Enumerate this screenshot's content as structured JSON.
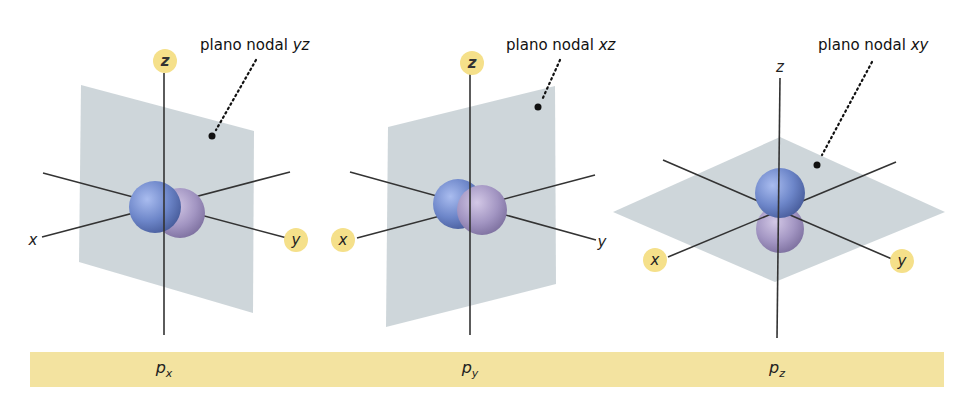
{
  "figure": {
    "panels": [
      {
        "id": "px",
        "orbital_label": "p",
        "orbital_subscript": "x",
        "nodal_plane_prefix": "plano nodal",
        "nodal_plane_axes": "yz",
        "axis_labels": {
          "x": "x",
          "y": "y",
          "z": "z"
        },
        "highlighted_axes": [
          "z",
          "y"
        ]
      },
      {
        "id": "py",
        "orbital_label": "p",
        "orbital_subscript": "y",
        "nodal_plane_prefix": "plano nodal",
        "nodal_plane_axes": "xz",
        "axis_labels": {
          "x": "x",
          "y": "y",
          "z": "z"
        },
        "highlighted_axes": [
          "z",
          "x"
        ]
      },
      {
        "id": "pz",
        "orbital_label": "p",
        "orbital_subscript": "z",
        "nodal_plane_prefix": "plano nodal",
        "nodal_plane_axes": "xy",
        "axis_labels": {
          "x": "x",
          "y": "y",
          "z": "z"
        },
        "highlighted_axes": [
          "x",
          "y"
        ]
      }
    ],
    "colors": {
      "caption_bar": "#f3e3a0",
      "axis_badge": "#f5e08a",
      "plane": "#c9d1d6",
      "lobe_blue": "#6d86c9",
      "lobe_violet": "#a89bc0",
      "axis_line": "#333333"
    }
  }
}
